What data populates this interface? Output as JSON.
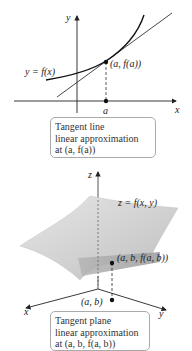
{
  "top_figure": {
    "axis_y_label": "y",
    "axis_x_label": "x",
    "curve_label": "y = f(x)",
    "point_label": "(a, f(a))",
    "tick_label": "a",
    "caption": {
      "line1": "Tangent line",
      "line2": "linear approximation",
      "line3": "at (a, f(a))"
    }
  },
  "bottom_figure": {
    "axis_z_label": "z",
    "axis_x_label": "x",
    "axis_y_label": "y",
    "surface_label": "z = f(x, y)",
    "point_label": "(a, b, f(a, b))",
    "base_point_label": "(a, b)",
    "caption": {
      "line1": "Tangent plane",
      "line2": "linear approximation",
      "line3": "at (a, b, f(a, b))"
    }
  },
  "colors": {
    "surface_light": "#d9d9d9",
    "surface_dark": "#a6a6a6",
    "ink": "#222222"
  }
}
